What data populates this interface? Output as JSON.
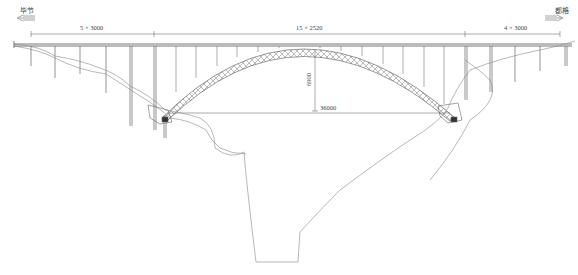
{
  "diagram": {
    "type": "bridge-elevation",
    "direction_left": {
      "label": "毕节",
      "arrow": "left-arrow-icon"
    },
    "direction_right": {
      "label": "都格",
      "arrow": "right-arrow-icon"
    },
    "spans": {
      "left_approach": "5 × 3000",
      "main_arch": "15 × 2520",
      "right_approach": "4 × 3000"
    },
    "arch": {
      "rise_label": "6900",
      "span_label": "36000"
    },
    "caption": "",
    "colors": {
      "line": "#555555",
      "terrain": "#888888",
      "background": "#ffffff"
    }
  }
}
